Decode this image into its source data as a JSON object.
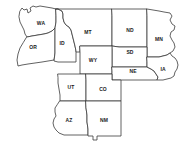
{
  "map": {
    "title": "Western and Midwestern United States",
    "background_color": "#ffffff",
    "border_color": "#3a3a3a",
    "label_color": "#1a1a1a",
    "projection_note": "selected states only",
    "states": [
      {
        "code": "WA",
        "name": "Washington",
        "label_x": 41,
        "label_y": 24,
        "path": "M 20 11 L 22 8 L 24 10 L 27 9 L 28 13 L 31 11 L 30 8 L 33 6 L 36 7 L 40 6 L 46 7 L 52 8 L 56 9 L 56 16 L 56 22 L 55 28 L 52 31 L 48 33 L 44 34 L 38 35 L 32 36 L 27 37 L 25 34 L 24 30 L 22 26 L 20 22 L 19 17 Z"
      },
      {
        "code": "OR",
        "name": "Oregon",
        "label_x": 33,
        "label_y": 48,
        "path": "M 27 37 L 32 36 L 38 35 L 44 34 L 48 33 L 52 31 L 55 28 L 55 34 L 55 40 L 55 47 L 55 53 L 54 60 L 48 61 L 42 62 L 35 63 L 28 64 L 22 65 L 18 66 L 17 60 L 18 54 L 20 48 L 23 43 Z"
      },
      {
        "code": "ID",
        "name": "Idaho",
        "label_x": 62,
        "label_y": 44,
        "path": "M 56 9 L 58 9 L 60 10 L 62 11 L 63 14 L 63 18 L 64 22 L 66 25 L 69 27 L 71 30 L 72 34 L 73 38 L 74 42 L 75 46 L 76 51 L 76 56 L 76 62 L 70 62 L 64 62 L 58 62 L 54 61 L 55 53 L 55 47 L 55 40 L 55 34 L 55 28 L 56 22 L 56 16 Z"
      },
      {
        "code": "MT",
        "name": "Montana",
        "label_x": 88,
        "label_y": 33,
        "path": "M 56 9 L 62 9 L 68 9 L 75 9 L 82 9 L 90 9 L 98 9 L 106 9 L 112 9 L 112 16 L 112 23 L 112 30 L 112 38 L 112 46 L 105 46 L 98 46 L 92 46 L 86 46 L 80 46 L 80 52 L 76 52 L 76 51 L 75 46 L 74 42 L 73 38 L 72 34 L 71 30 L 69 27 L 66 25 L 64 22 L 63 18 L 63 14 L 62 11 L 60 10 L 58 9 Z"
      },
      {
        "code": "ND",
        "name": "North Dakota",
        "label_x": 130,
        "label_y": 31,
        "path": "M 112 9 L 119 9 L 126 9 L 133 9 L 140 9 L 147 9 L 147 16 L 147 24 L 147 32 L 147 40 L 147 47 L 140 47 L 133 47 L 126 47 L 119 47 L 112 46 L 112 38 L 112 30 L 112 23 L 112 16 Z"
      },
      {
        "code": "MN",
        "name": "Minnesota",
        "label_x": 159,
        "label_y": 40,
        "path": "M 147 9 L 153 10 L 159 11 L 164 12 L 170 13 L 172 16 L 170 20 L 172 24 L 175 26 L 174 30 L 171 32 L 170 36 L 172 40 L 174 43 L 175 47 L 173 51 L 170 53 L 167 55 L 163 56 L 159 57 L 155 57 L 151 57 L 147 57 L 147 52 L 147 47 L 147 40 L 147 32 L 147 24 L 147 16 Z"
      },
      {
        "code": "SD",
        "name": "South Dakota",
        "label_x": 130,
        "label_y": 53,
        "path": "M 112 46 L 119 47 L 126 47 L 133 47 L 140 47 L 147 47 L 147 52 L 147 57 L 147 62 L 147 67 L 140 67 L 133 67 L 126 67 L 119 67 L 112 67 L 112 61 L 112 55 L 112 50 Z"
      },
      {
        "code": "WY",
        "name": "Wyoming",
        "label_x": 93,
        "label_y": 61,
        "path": "M 80 46 L 86 46 L 92 46 L 98 46 L 105 46 L 112 46 L 112 50 L 112 55 L 112 61 L 112 67 L 112 74 L 105 74 L 98 74 L 92 74 L 86 74 L 80 74 L 80 68 L 80 62 L 80 56 L 80 52 Z"
      },
      {
        "code": "NE",
        "name": "Nebraska",
        "label_x": 133,
        "label_y": 72,
        "path": "M 112 67 L 119 67 L 126 67 L 133 67 L 140 67 L 147 67 L 151 69 L 154 71 L 156 74 L 158 77 L 157 80 L 152 80 L 146 80 L 139 80 L 132 80 L 125 80 L 118 80 L 112 80 L 112 76 L 112 71 Z"
      },
      {
        "code": "IA",
        "name": "Iowa",
        "label_x": 163,
        "label_y": 70,
        "path": "M 147 57 L 151 57 L 155 57 L 159 57 L 163 56 L 167 55 L 170 53 L 172 56 L 175 58 L 177 61 L 178 65 L 177 69 L 175 72 L 174 76 L 171 78 L 167 79 L 163 80 L 159 80 L 157 80 L 158 77 L 156 74 L 154 71 L 151 69 L 147 67 L 147 62 Z"
      },
      {
        "code": "UT",
        "name": "Utah",
        "label_x": 71,
        "label_y": 88,
        "path": "M 58 74 L 64 74 L 70 74 L 76 74 L 80 74 L 86 74 L 86 80 L 86 87 L 86 94 L 86 101 L 80 101 L 73 101 L 66 101 L 60 101 L 60 95 L 59 89 L 58 83 L 58 78 Z"
      },
      {
        "code": "CO",
        "name": "Colorado",
        "label_x": 103,
        "label_y": 90,
        "path": "M 86 74 L 92 74 L 98 74 L 105 74 L 112 74 L 112 80 L 118 80 L 121 80 L 121 87 L 121 94 L 121 101 L 114 101 L 107 101 L 100 101 L 93 101 L 86 101 L 86 94 L 86 87 L 86 80 Z"
      },
      {
        "code": "AZ",
        "name": "Arizona",
        "label_x": 69,
        "label_y": 121,
        "path": "M 60 101 L 66 101 L 73 101 L 80 101 L 86 101 L 86 108 L 87 115 L 87 122 L 88 129 L 88 135 L 82 135 L 76 135 L 70 135 L 64 135 L 59 133 L 56 130 L 54 127 L 53 123 L 54 119 L 56 116 L 55 112 L 55 108 L 57 105 Z"
      },
      {
        "code": "NM",
        "name": "New Mexico",
        "label_x": 104,
        "label_y": 121,
        "path": "M 86 101 L 93 101 L 100 101 L 107 101 L 114 101 L 121 101 L 121 108 L 121 115 L 121 122 L 121 129 L 121 136 L 115 136 L 109 136 L 103 136 L 97 136 L 97 140 L 93 140 L 93 136 L 90 136 L 88 136 L 88 135 L 88 129 L 87 122 L 87 115 L 86 108 Z"
      }
    ]
  }
}
